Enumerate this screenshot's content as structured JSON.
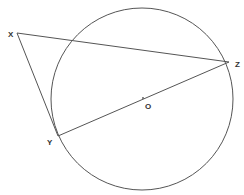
{
  "diagram": {
    "type": "geometry",
    "colors": {
      "stroke": "#555555",
      "label": "#333333",
      "background": "#ffffff"
    },
    "circle": {
      "center_label": "O",
      "cx": 142,
      "cy": 99,
      "r": 91
    },
    "points": [
      {
        "id": "X",
        "label": "X",
        "x": 17,
        "y": 33,
        "label_x": 8,
        "label_y": 37
      },
      {
        "id": "Y",
        "label": "Y",
        "x": 58,
        "y": 136,
        "label_x": 47,
        "label_y": 145
      },
      {
        "id": "Z",
        "label": "Z",
        "x": 229,
        "y": 62,
        "label_x": 235,
        "label_y": 67
      },
      {
        "id": "O",
        "label": "O",
        "x": 143,
        "y": 98,
        "label_x": 145,
        "label_y": 109
      }
    ],
    "segments": [
      {
        "from": "X",
        "to": "Z"
      },
      {
        "from": "X",
        "to": "Y"
      },
      {
        "from": "Y",
        "to": "Z"
      }
    ]
  }
}
